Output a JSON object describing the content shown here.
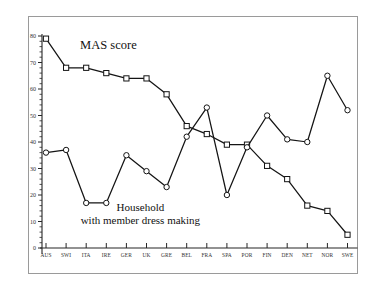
{
  "chart_data": {
    "type": "line",
    "title": "",
    "subtitle": "",
    "xlabel": "",
    "ylabel": "",
    "ylim": [
      0,
      80
    ],
    "ytick_step": 10,
    "yticks": [
      0,
      10,
      20,
      30,
      40,
      50,
      60,
      70,
      80
    ],
    "ytick_labels": [
      "0",
      "10",
      "20",
      "30",
      "40",
      "50",
      "60",
      "70",
      "80"
    ],
    "minor_ticks": true,
    "grid": false,
    "legend": "none",
    "categories": [
      "AUS",
      "SWI",
      "ITA",
      "IRE",
      "GER",
      "UK",
      "GRE",
      "BEL",
      "FRA",
      "SPA",
      "POR",
      "FIN",
      "DEN",
      "NET",
      "NOR",
      "SWE"
    ],
    "series": [
      {
        "name": "MAS score",
        "marker": "square",
        "annotation": "MAS score",
        "values": [
          79,
          68,
          68,
          66,
          64,
          64,
          58,
          46,
          43,
          39,
          39,
          31,
          26,
          16,
          14,
          5
        ]
      },
      {
        "name": "Household with member dress making",
        "marker": "circle",
        "annotation": "Household\nwith member dress making",
        "annotation_line1": "Household",
        "annotation_line2": "with member dress making",
        "values": [
          36,
          37,
          17,
          17,
          35,
          29,
          23,
          42,
          53,
          20,
          38,
          50,
          41,
          40,
          65,
          52
        ]
      }
    ],
    "annotations": [
      {
        "text": "MAS score",
        "x_category": "SWI",
        "y": 75
      },
      {
        "text": "Household",
        "x_category": "GER",
        "y": 14
      },
      {
        "text": "with member dress making",
        "x_category": "GER",
        "y": 9
      }
    ],
    "colors": {
      "line": "#141414",
      "marker_fill": "#ffffff",
      "axis": "#262626",
      "frame": "#9a9a9a",
      "background": "#ffffff"
    }
  }
}
